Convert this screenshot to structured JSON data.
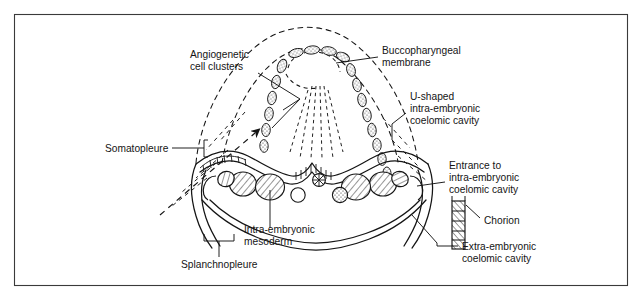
{
  "figure": {
    "kind": "embryology-diagram",
    "title_visible": false,
    "frame": {
      "border_color": "#3a3a3a",
      "background": "#ffffff",
      "x": 14,
      "y": 14,
      "width": 614,
      "height": 272
    },
    "ink_color": "#151515",
    "line_color": "#151515"
  },
  "labels": {
    "angiogenetic": {
      "line1": "Angiogenetic",
      "line2": "cell clusters",
      "x": 190,
      "y": 58
    },
    "buccopharyngeal": {
      "line1": "Buccopharyngeal",
      "line2": "membrane",
      "x": 382,
      "y": 54
    },
    "u_shaped": {
      "line1": "U-shaped",
      "line2": "intra-embryonic",
      "line3": "coelomic cavity",
      "x": 410,
      "y": 100
    },
    "somatopleure": {
      "line1": "Somatopleure",
      "x": 105,
      "y": 148
    },
    "entrance": {
      "line1": "Entrance to",
      "line2": "intra-embryonic",
      "line3": "coelomic cavity",
      "x": 449,
      "y": 169
    },
    "chorion": {
      "line1": "Chorion",
      "x": 484,
      "y": 221
    },
    "extra_embryonic": {
      "line1": "Extra-embryonic",
      "line2": "coelomic cavity",
      "x": 462,
      "y": 248
    },
    "intra_embryonic_mesoderm": {
      "line1": "Intra-embryonic",
      "line2": "mesoderm",
      "x": 244,
      "y": 233
    },
    "splanchnopleure": {
      "line1": "Splanchnopleure",
      "x": 181,
      "y": 265
    }
  },
  "structures": {
    "cell_clusters_left_count": 7,
    "cell_clusters_right_count": 8,
    "cell_clusters_apex_count": 3,
    "coelom_lobes_left_count": 3,
    "coelom_lobes_right_count": 3,
    "central_bodies": [
      {
        "name": "notochord",
        "style": "spoked-circle"
      },
      {
        "name": "plain-vesicle",
        "style": "open-circle"
      },
      {
        "name": "stippled-vesicle",
        "style": "stippled-circle"
      }
    ],
    "chorion_block": {
      "hatch": "diagonal",
      "rows": 5
    }
  }
}
